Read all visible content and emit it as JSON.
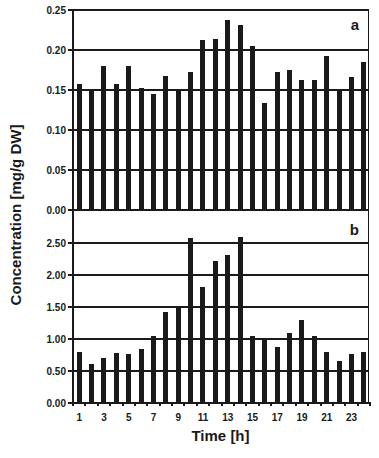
{
  "chart_data": [
    {
      "type": "bar",
      "panel": "a",
      "title": "",
      "xlabel": "Time [h]",
      "ylabel": "Concentration [mg/g DW]",
      "ylim": [
        0,
        0.25
      ],
      "yticks": [
        "0.00",
        "0.05",
        "0.10",
        "0.15",
        "0.20",
        "0.25"
      ],
      "grid": true,
      "categories": [
        1,
        2,
        3,
        4,
        5,
        6,
        7,
        8,
        9,
        10,
        11,
        12,
        13,
        14,
        15,
        16,
        17,
        18,
        19,
        20,
        21,
        22,
        23,
        24
      ],
      "values": [
        0.158,
        0.15,
        0.18,
        0.158,
        0.18,
        0.153,
        0.145,
        0.168,
        0.15,
        0.172,
        0.212,
        0.214,
        0.237,
        0.231,
        0.205,
        0.134,
        0.173,
        0.175,
        0.162,
        0.162,
        0.192,
        0.15,
        0.166,
        0.185
      ]
    },
    {
      "type": "bar",
      "panel": "b",
      "title": "",
      "xlabel": "Time [h]",
      "ylabel": "Concentration [mg/g DW]",
      "ylim": [
        0,
        2.75
      ],
      "yticks": [
        "0.00",
        "0.50",
        "1.00",
        "1.50",
        "2.00",
        "2.50"
      ],
      "grid": true,
      "categories": [
        1,
        2,
        3,
        4,
        5,
        6,
        7,
        8,
        9,
        10,
        11,
        12,
        13,
        14,
        15,
        16,
        17,
        18,
        19,
        20,
        21,
        22,
        23,
        24
      ],
      "values": [
        0.79,
        0.61,
        0.7,
        0.78,
        0.77,
        0.84,
        1.04,
        1.42,
        1.5,
        2.58,
        1.81,
        2.22,
        2.31,
        2.59,
        1.04,
        1.0,
        0.87,
        1.09,
        1.29,
        1.04,
        0.8,
        0.66,
        0.76,
        0.8
      ]
    }
  ],
  "labels": {
    "ylabel": "Concentration [mg/g DW]",
    "xlabel": "Time [h]",
    "panel_a": "a",
    "panel_b": "b",
    "xticklabels": [
      "1",
      "3",
      "5",
      "7",
      "9",
      "11",
      "13",
      "15",
      "17",
      "19",
      "21",
      "23"
    ]
  },
  "colors": {
    "bar": "#1a1a1a",
    "grid": "#1a1a1a",
    "background": "#ffffff"
  }
}
